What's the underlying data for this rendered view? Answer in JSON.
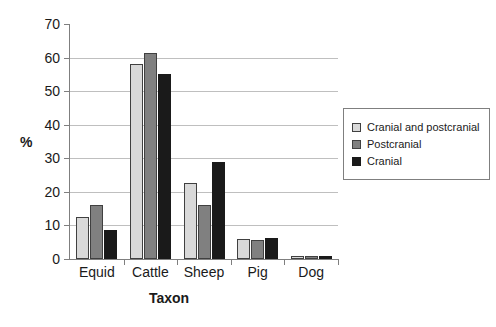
{
  "chart_data": {
    "type": "bar",
    "title": "",
    "xlabel": "Taxon",
    "ylabel": "%",
    "categories": [
      "Equid",
      "Cattle",
      "Sheep",
      "Pig",
      "Dog"
    ],
    "series": [
      {
        "name": "Cranial and postcranial",
        "color": "#d9d9d9",
        "values": [
          12.5,
          58,
          22.5,
          6,
          1
        ]
      },
      {
        "name": "Postcranial",
        "color": "#808080",
        "values": [
          16,
          61.5,
          16,
          5.8,
          1
        ]
      },
      {
        "name": "Cranial",
        "color": "#1a1a1a",
        "values": [
          8.7,
          55,
          29,
          6.3,
          1
        ]
      }
    ],
    "ylim": [
      0,
      70
    ],
    "yticks": [
      0,
      10,
      20,
      30,
      40,
      50,
      60,
      70
    ],
    "ytick_labels": [
      "0",
      "10",
      "20",
      "30",
      "40",
      "50",
      "60",
      "70"
    ],
    "grid": true,
    "legend_position": "right"
  }
}
